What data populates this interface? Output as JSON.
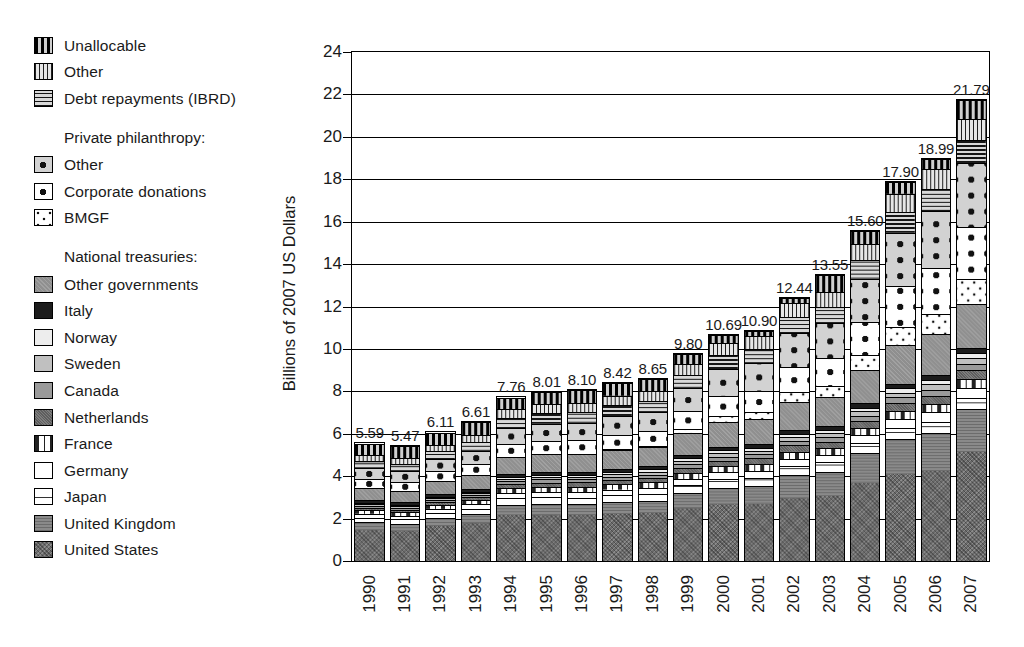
{
  "chart_data": {
    "type": "bar",
    "stacked": true,
    "title": "",
    "subtitle": "",
    "xlabel": "",
    "ylabel": "Billions of 2007 US Dollars",
    "ylim": [
      0,
      24
    ],
    "ytick_step": 2,
    "yticks": [
      "24",
      "22",
      "20",
      "18",
      "16",
      "14",
      "12",
      "10",
      "8",
      "6",
      "4",
      "2",
      "0"
    ],
    "grid": true,
    "legend_position": "left-outside",
    "categories": [
      "1990",
      "1991",
      "1992",
      "1993",
      "1994",
      "1995",
      "1996",
      "1997",
      "1998",
      "1999",
      "2000",
      "2001",
      "2002",
      "2003",
      "2004",
      "2005",
      "2006",
      "2007"
    ],
    "totals": [
      5.59,
      5.47,
      6.11,
      6.61,
      7.76,
      8.01,
      8.1,
      8.42,
      8.65,
      9.8,
      10.69,
      10.9,
      12.44,
      13.55,
      15.6,
      17.9,
      18.99,
      21.79
    ],
    "total_labels": [
      "5.59",
      "5.47",
      "6.11",
      "6.61",
      "7.76",
      "8.01",
      "8.10",
      "8.42",
      "8.65",
      "9.80",
      "10.69",
      "10.90",
      "12.44",
      "13.55",
      "15.60",
      "17.90",
      "18.99",
      "21.79"
    ],
    "series": [
      {
        "name": "United States",
        "key": "us",
        "pattern": "p-us",
        "values": [
          1.48,
          1.42,
          1.66,
          1.82,
          2.18,
          2.22,
          2.22,
          2.28,
          2.36,
          2.49,
          2.68,
          2.72,
          3.0,
          3.32,
          3.95,
          4.33,
          4.48,
          5.62
        ]
      },
      {
        "name": "United Kingdom",
        "key": "uk",
        "pattern": "p-uk",
        "values": [
          0.36,
          0.35,
          0.38,
          0.42,
          0.5,
          0.52,
          0.54,
          0.58,
          0.6,
          0.72,
          0.8,
          0.82,
          1.06,
          1.24,
          1.48,
          1.78,
          1.9,
          2.22
        ]
      },
      {
        "name": "Japan",
        "key": "japan",
        "pattern": "p-japan",
        "values": [
          0.22,
          0.21,
          0.24,
          0.25,
          0.3,
          0.32,
          0.33,
          0.34,
          0.35,
          0.38,
          0.4,
          0.41,
          0.44,
          0.46,
          0.5,
          0.54,
          0.56,
          0.6
        ]
      },
      {
        "name": "Germany",
        "key": "germany",
        "pattern": "p-germany",
        "values": [
          0.18,
          0.17,
          0.19,
          0.2,
          0.25,
          0.26,
          0.27,
          0.27,
          0.28,
          0.3,
          0.32,
          0.33,
          0.35,
          0.37,
          0.4,
          0.44,
          0.46,
          0.5
        ]
      },
      {
        "name": "France",
        "key": "france",
        "pattern": "p-france",
        "values": [
          0.17,
          0.17,
          0.18,
          0.19,
          0.23,
          0.25,
          0.25,
          0.26,
          0.27,
          0.29,
          0.3,
          0.31,
          0.33,
          0.35,
          0.38,
          0.42,
          0.44,
          0.48
        ]
      },
      {
        "name": "Netherlands",
        "key": "netherlands",
        "pattern": "p-neth",
        "values": [
          0.13,
          0.13,
          0.14,
          0.15,
          0.19,
          0.2,
          0.21,
          0.21,
          0.22,
          0.24,
          0.26,
          0.27,
          0.29,
          0.31,
          0.34,
          0.37,
          0.39,
          0.42
        ]
      },
      {
        "name": "Canada",
        "key": "canada",
        "pattern": "p-canada",
        "values": [
          0.09,
          0.09,
          0.1,
          0.11,
          0.14,
          0.15,
          0.15,
          0.16,
          0.16,
          0.18,
          0.19,
          0.2,
          0.22,
          0.24,
          0.26,
          0.29,
          0.3,
          0.33
        ]
      },
      {
        "name": "Sweden",
        "key": "sweden",
        "pattern": "p-sweden",
        "values": [
          0.08,
          0.08,
          0.09,
          0.09,
          0.12,
          0.12,
          0.13,
          0.13,
          0.14,
          0.15,
          0.16,
          0.17,
          0.18,
          0.2,
          0.22,
          0.24,
          0.26,
          0.28
        ]
      },
      {
        "name": "Norway",
        "key": "norway",
        "pattern": "p-norway",
        "values": [
          0.06,
          0.06,
          0.07,
          0.07,
          0.09,
          0.1,
          0.1,
          0.11,
          0.11,
          0.12,
          0.13,
          0.14,
          0.15,
          0.17,
          0.19,
          0.21,
          0.23,
          0.26
        ]
      },
      {
        "name": "Italy",
        "key": "italy",
        "pattern": "p-italy",
        "values": [
          0.12,
          0.11,
          0.12,
          0.12,
          0.14,
          0.14,
          0.14,
          0.15,
          0.15,
          0.16,
          0.17,
          0.17,
          0.18,
          0.19,
          0.21,
          0.23,
          0.25,
          0.27
        ]
      },
      {
        "name": "Other governments",
        "key": "other_governments",
        "pattern": "p-othergov",
        "values": [
          0.58,
          0.56,
          0.63,
          0.68,
          0.82,
          0.86,
          0.88,
          0.92,
          0.95,
          1.06,
          1.16,
          1.18,
          1.34,
          1.48,
          1.7,
          1.92,
          2.02,
          2.3
        ]
      },
      {
        "name": "BMGF",
        "key": "bmgf",
        "pattern": "p-bmgf",
        "values": [
          0.0,
          0.0,
          0.0,
          0.0,
          0.0,
          0.0,
          0.0,
          0.02,
          0.06,
          0.18,
          0.3,
          0.34,
          0.46,
          0.58,
          0.74,
          0.92,
          1.02,
          1.24
        ]
      },
      {
        "name": "Corporate donations",
        "key": "corporate_donations",
        "pattern": "p-corp",
        "values": [
          0.42,
          0.41,
          0.46,
          0.5,
          0.6,
          0.64,
          0.66,
          0.7,
          0.72,
          0.84,
          0.96,
          1.0,
          1.2,
          1.38,
          1.66,
          2.04,
          2.26,
          2.7
        ]
      },
      {
        "name": "Other",
        "key": "private_other",
        "pattern": "p-privother",
        "values": [
          0.52,
          0.51,
          0.58,
          0.63,
          0.76,
          0.82,
          0.84,
          0.9,
          0.94,
          1.1,
          1.26,
          1.32,
          1.58,
          1.82,
          2.18,
          2.66,
          2.86,
          3.32
        ]
      },
      {
        "name": "Debt repayments (IBRD)",
        "key": "ibrd",
        "pattern": "p-ibrd",
        "values": [
          0.36,
          0.35,
          0.38,
          0.41,
          0.48,
          0.5,
          0.51,
          0.53,
          0.55,
          0.6,
          0.66,
          0.68,
          0.76,
          0.82,
          0.92,
          1.02,
          1.08,
          1.18
        ]
      },
      {
        "name": "Other",
        "key": "other",
        "pattern": "p-other",
        "values": [
          0.3,
          0.29,
          0.32,
          0.35,
          0.41,
          0.43,
          0.44,
          0.46,
          0.48,
          0.52,
          0.56,
          0.58,
          0.66,
          0.72,
          0.82,
          0.92,
          0.98,
          1.08
        ]
      },
      {
        "name": "Unallocable",
        "key": "unallocable",
        "pattern": "p-unalloc",
        "values": [
          0.52,
          0.56,
          0.57,
          0.62,
          0.55,
          0.58,
          0.63,
          0.6,
          0.61,
          0.47,
          0.38,
          0.26,
          0.24,
          0.9,
          0.65,
          0.57,
          0.5,
          0.99
        ]
      }
    ]
  },
  "legend": {
    "groups": [
      {
        "heading": null,
        "items": [
          {
            "label": "Unallocable",
            "pattern": "p-unalloc",
            "icon": "swatch-unallocable"
          },
          {
            "label": "Other",
            "pattern": "p-other",
            "icon": "swatch-other"
          },
          {
            "label": "Debt repayments (IBRD)",
            "pattern": "p-ibrd",
            "icon": "swatch-ibrd"
          }
        ]
      },
      {
        "heading": "Private philanthropy:",
        "items": [
          {
            "label": "Other",
            "pattern": "p-privother",
            "icon": "swatch-private-other"
          },
          {
            "label": "Corporate donations",
            "pattern": "p-corp",
            "icon": "swatch-corporate-donations"
          },
          {
            "label": "BMGF",
            "pattern": "p-bmgf",
            "icon": "swatch-bmgf"
          }
        ]
      },
      {
        "heading": "National treasuries:",
        "items": [
          {
            "label": "Other governments",
            "pattern": "p-othergov",
            "icon": "swatch-other-governments"
          },
          {
            "label": "Italy",
            "pattern": "p-italy",
            "icon": "swatch-italy"
          },
          {
            "label": "Norway",
            "pattern": "p-norway",
            "icon": "swatch-norway"
          },
          {
            "label": "Sweden",
            "pattern": "p-sweden",
            "icon": "swatch-sweden"
          },
          {
            "label": "Canada",
            "pattern": "p-canada",
            "icon": "swatch-canada"
          },
          {
            "label": "Netherlands",
            "pattern": "p-neth",
            "icon": "swatch-netherlands"
          },
          {
            "label": "France",
            "pattern": "p-france",
            "icon": "swatch-france"
          },
          {
            "label": "Germany",
            "pattern": "p-germany",
            "icon": "swatch-germany"
          },
          {
            "label": "Japan",
            "pattern": "p-japan",
            "icon": "swatch-japan"
          },
          {
            "label": "United Kingdom",
            "pattern": "p-uk",
            "icon": "swatch-united-kingdom"
          },
          {
            "label": "United States",
            "pattern": "p-us",
            "icon": "swatch-united-states"
          }
        ]
      }
    ]
  },
  "colors": {
    "ink": "#1a1a1a",
    "axis": "#000000",
    "background": "#ffffff"
  }
}
